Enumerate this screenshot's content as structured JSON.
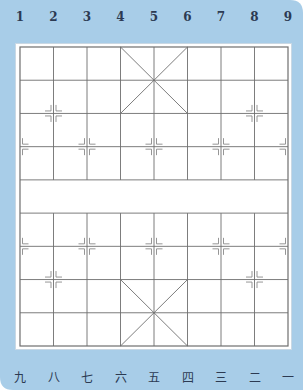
{
  "board": {
    "type": "xiangqi",
    "files": 9,
    "ranks": 10,
    "river_text": "",
    "colors": {
      "frame": "#a8cde8",
      "board": "#ffffff",
      "line": "#6e6e6e",
      "mark": "#8a8a8a",
      "label": "#2c3a52"
    }
  },
  "top_labels": [
    "1",
    "2",
    "3",
    "4",
    "5",
    "6",
    "7",
    "8",
    "9"
  ],
  "bottom_labels": [
    "九",
    "八",
    "七",
    "六",
    "五",
    "四",
    "三",
    "二",
    "一"
  ],
  "marks": {
    "cannon": [
      [
        1,
        2
      ],
      [
        7,
        2
      ],
      [
        1,
        7
      ],
      [
        7,
        7
      ]
    ],
    "soldier": [
      [
        0,
        3
      ],
      [
        2,
        3
      ],
      [
        4,
        3
      ],
      [
        6,
        3
      ],
      [
        8,
        3
      ],
      [
        0,
        6
      ],
      [
        2,
        6
      ],
      [
        4,
        6
      ],
      [
        6,
        6
      ],
      [
        8,
        6
      ]
    ]
  }
}
